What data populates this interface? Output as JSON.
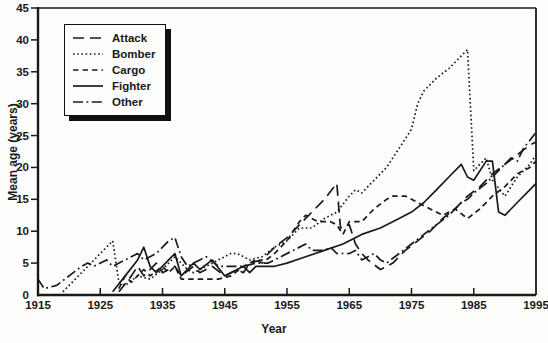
{
  "figure": {
    "background": "#fdfdfb",
    "line_color": "#1a1a1a",
    "text_color": "#1a1a1a"
  },
  "chart_data": {
    "type": "line",
    "xlabel": "Year",
    "ylabel": "Mean age (years)",
    "xlim": [
      1915,
      1995
    ],
    "ylim": [
      0,
      45
    ],
    "x_ticks": [
      1915,
      1925,
      1935,
      1945,
      1955,
      1965,
      1975,
      1985,
      1995
    ],
    "y_ticks": [
      0,
      5,
      10,
      15,
      20,
      25,
      30,
      35,
      40,
      45
    ],
    "grid": false,
    "legend_position": "upper-left",
    "series": [
      {
        "name": "Attack",
        "style": "long-dash",
        "points": [
          [
            1928,
            0.5
          ],
          [
            1930,
            3
          ],
          [
            1931,
            4.5
          ],
          [
            1932,
            3
          ],
          [
            1934,
            5
          ],
          [
            1935,
            3.5
          ],
          [
            1937,
            4.5
          ],
          [
            1938,
            3
          ],
          [
            1940,
            4.5
          ],
          [
            1941,
            3.5
          ],
          [
            1943,
            4.5
          ],
          [
            1945,
            3
          ],
          [
            1947,
            4
          ],
          [
            1948,
            3.5
          ],
          [
            1949,
            5
          ],
          [
            1951,
            5.5
          ],
          [
            1953,
            7.5
          ],
          [
            1955,
            9
          ],
          [
            1957,
            11
          ],
          [
            1959,
            13
          ],
          [
            1961,
            15
          ],
          [
            1963,
            17.5
          ],
          [
            1963.6,
            10.5
          ],
          [
            1965,
            11
          ],
          [
            1966,
            8
          ],
          [
            1967,
            6.5
          ],
          [
            1968,
            5.5
          ],
          [
            1970,
            4
          ],
          [
            1972,
            5
          ],
          [
            1974,
            7
          ],
          [
            1976,
            8.5
          ],
          [
            1978,
            10
          ],
          [
            1980,
            12
          ],
          [
            1982,
            13.5
          ],
          [
            1984,
            15.5
          ],
          [
            1986,
            17
          ],
          [
            1988,
            19
          ],
          [
            1990,
            20.5
          ],
          [
            1992,
            22
          ],
          [
            1994,
            23.5
          ],
          [
            1995,
            24
          ]
        ]
      },
      {
        "name": "Bomber",
        "style": "dotted",
        "points": [
          [
            1919,
            0.5
          ],
          [
            1921,
            2.5
          ],
          [
            1923,
            4.5
          ],
          [
            1925,
            6.5
          ],
          [
            1927,
            8.5
          ],
          [
            1928,
            2
          ],
          [
            1929,
            1.5
          ],
          [
            1931,
            3
          ],
          [
            1933,
            2.5
          ],
          [
            1935,
            4
          ],
          [
            1937,
            6
          ],
          [
            1939,
            4
          ],
          [
            1940,
            3.5
          ],
          [
            1942,
            4.5
          ],
          [
            1944,
            5.5
          ],
          [
            1946,
            6.5
          ],
          [
            1947,
            6.5
          ],
          [
            1949,
            5.5
          ],
          [
            1951,
            6
          ],
          [
            1953,
            7.5
          ],
          [
            1955,
            8.5
          ],
          [
            1957,
            10.5
          ],
          [
            1959,
            10.5
          ],
          [
            1961,
            12
          ],
          [
            1963,
            13
          ],
          [
            1965,
            15.5
          ],
          [
            1966,
            16.5
          ],
          [
            1967,
            16
          ],
          [
            1969,
            18
          ],
          [
            1971,
            20
          ],
          [
            1973,
            23
          ],
          [
            1975,
            26
          ],
          [
            1976,
            30
          ],
          [
            1977,
            32
          ],
          [
            1979,
            34
          ],
          [
            1981,
            35.5
          ],
          [
            1983,
            37.5
          ],
          [
            1984,
            38.5
          ],
          [
            1985,
            19.5
          ],
          [
            1987,
            21.5
          ],
          [
            1988,
            18
          ],
          [
            1990,
            15.5
          ],
          [
            1992,
            18.5
          ],
          [
            1994,
            20.5
          ],
          [
            1995,
            22
          ]
        ]
      },
      {
        "name": "Cargo",
        "style": "dash",
        "points": [
          [
            1928,
            1
          ],
          [
            1929,
            3
          ],
          [
            1930,
            2
          ],
          [
            1932,
            4
          ],
          [
            1933,
            3
          ],
          [
            1935,
            4.5
          ],
          [
            1936,
            3.5
          ],
          [
            1937,
            4.5
          ],
          [
            1938,
            2.5
          ],
          [
            1940,
            2.5
          ],
          [
            1942,
            2.5
          ],
          [
            1944,
            2.5
          ],
          [
            1946,
            3
          ],
          [
            1948,
            4.5
          ],
          [
            1950,
            5.5
          ],
          [
            1951,
            5
          ],
          [
            1953,
            6.5
          ],
          [
            1955,
            8.5
          ],
          [
            1957,
            11.5
          ],
          [
            1958,
            12.5
          ],
          [
            1960,
            11.5
          ],
          [
            1962,
            11.5
          ],
          [
            1963,
            11
          ],
          [
            1964,
            9.5
          ],
          [
            1965,
            11.5
          ],
          [
            1967,
            11.5
          ],
          [
            1969,
            13.5
          ],
          [
            1971,
            15
          ],
          [
            1972,
            15.5
          ],
          [
            1974,
            15.5
          ],
          [
            1976,
            14.5
          ],
          [
            1978,
            13.5
          ],
          [
            1980,
            12.5
          ],
          [
            1982,
            13.5
          ],
          [
            1984,
            12
          ],
          [
            1986,
            13.5
          ],
          [
            1988,
            15.5
          ],
          [
            1990,
            17
          ],
          [
            1992,
            19
          ],
          [
            1994,
            20
          ],
          [
            1995,
            21
          ]
        ]
      },
      {
        "name": "Fighter",
        "style": "solid",
        "points": [
          [
            1927,
            0.5
          ],
          [
            1929,
            3
          ],
          [
            1931,
            5.5
          ],
          [
            1932,
            7.5
          ],
          [
            1933,
            4.5
          ],
          [
            1934,
            3.5
          ],
          [
            1936,
            5.5
          ],
          [
            1937,
            6.5
          ],
          [
            1938,
            3
          ],
          [
            1940,
            5
          ],
          [
            1941,
            4
          ],
          [
            1943,
            5.5
          ],
          [
            1945,
            3
          ],
          [
            1947,
            4
          ],
          [
            1948,
            4.5
          ],
          [
            1949,
            3.5
          ],
          [
            1950,
            4.5
          ],
          [
            1953,
            4.5
          ],
          [
            1955,
            5
          ],
          [
            1958,
            6
          ],
          [
            1961,
            7
          ],
          [
            1964,
            8
          ],
          [
            1967,
            9.5
          ],
          [
            1970,
            10.5
          ],
          [
            1973,
            12
          ],
          [
            1975,
            13
          ],
          [
            1977,
            14.5
          ],
          [
            1979,
            16.5
          ],
          [
            1981,
            18.5
          ],
          [
            1983,
            20.5
          ],
          [
            1984,
            18.5
          ],
          [
            1985,
            18
          ],
          [
            1987,
            21
          ],
          [
            1988,
            21
          ],
          [
            1989,
            13
          ],
          [
            1990,
            12.5
          ],
          [
            1992,
            14.5
          ],
          [
            1994,
            16.5
          ],
          [
            1995,
            17.5
          ]
        ]
      },
      {
        "name": "Other",
        "style": "dash-dot",
        "points": [
          [
            1915,
            2.5
          ],
          [
            1916,
            1
          ],
          [
            1918,
            1.5
          ],
          [
            1920,
            3
          ],
          [
            1922,
            4.5
          ],
          [
            1923,
            5
          ],
          [
            1924,
            4.5
          ],
          [
            1926,
            5.5
          ],
          [
            1927,
            4.5
          ],
          [
            1929,
            5.5
          ],
          [
            1931,
            6.5
          ],
          [
            1932,
            5.5
          ],
          [
            1934,
            6.5
          ],
          [
            1936,
            8.5
          ],
          [
            1937,
            9
          ],
          [
            1938,
            6
          ],
          [
            1939,
            4.5
          ],
          [
            1941,
            5.5
          ],
          [
            1942,
            6
          ],
          [
            1944,
            4.5
          ],
          [
            1946,
            4.5
          ],
          [
            1948,
            4.5
          ],
          [
            1950,
            5
          ],
          [
            1952,
            5
          ],
          [
            1954,
            6
          ],
          [
            1956,
            7
          ],
          [
            1958,
            8
          ],
          [
            1959,
            7
          ],
          [
            1961,
            7
          ],
          [
            1962,
            7.5
          ],
          [
            1963,
            6.5
          ],
          [
            1965,
            6.5
          ],
          [
            1966,
            7
          ],
          [
            1967,
            5.5
          ],
          [
            1969,
            6.5
          ],
          [
            1970,
            5.5
          ],
          [
            1971,
            5
          ],
          [
            1973,
            6.5
          ],
          [
            1975,
            8
          ],
          [
            1977,
            9.5
          ],
          [
            1979,
            11
          ],
          [
            1981,
            12.5
          ],
          [
            1983,
            14.5
          ],
          [
            1984,
            15
          ],
          [
            1985,
            16
          ],
          [
            1987,
            17.5
          ],
          [
            1989,
            19.5
          ],
          [
            1991,
            21.5
          ],
          [
            1992,
            21
          ],
          [
            1993,
            23
          ],
          [
            1995,
            25.5
          ]
        ]
      }
    ]
  }
}
